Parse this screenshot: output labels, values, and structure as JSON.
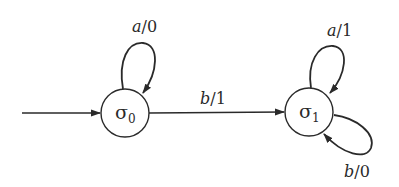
{
  "diagram": {
    "type": "finite-state-machine",
    "stroke_color": "#2a2a2a",
    "background": "#ffffff",
    "states": [
      {
        "id": "s0",
        "symbol": "σ",
        "subscript": "0",
        "initial": true
      },
      {
        "id": "s1",
        "symbol": "σ",
        "subscript": "1",
        "initial": false
      }
    ],
    "transitions": [
      {
        "from": "s0",
        "to": "s0",
        "input": "a",
        "sep": "/",
        "output": "0"
      },
      {
        "from": "s0",
        "to": "s1",
        "input": "b",
        "sep": "/",
        "output": "1"
      },
      {
        "from": "s1",
        "to": "s1",
        "input": "a",
        "sep": "/",
        "output": "1"
      },
      {
        "from": "s1",
        "to": "s1",
        "input": "b",
        "sep": "/",
        "output": "0"
      }
    ]
  }
}
